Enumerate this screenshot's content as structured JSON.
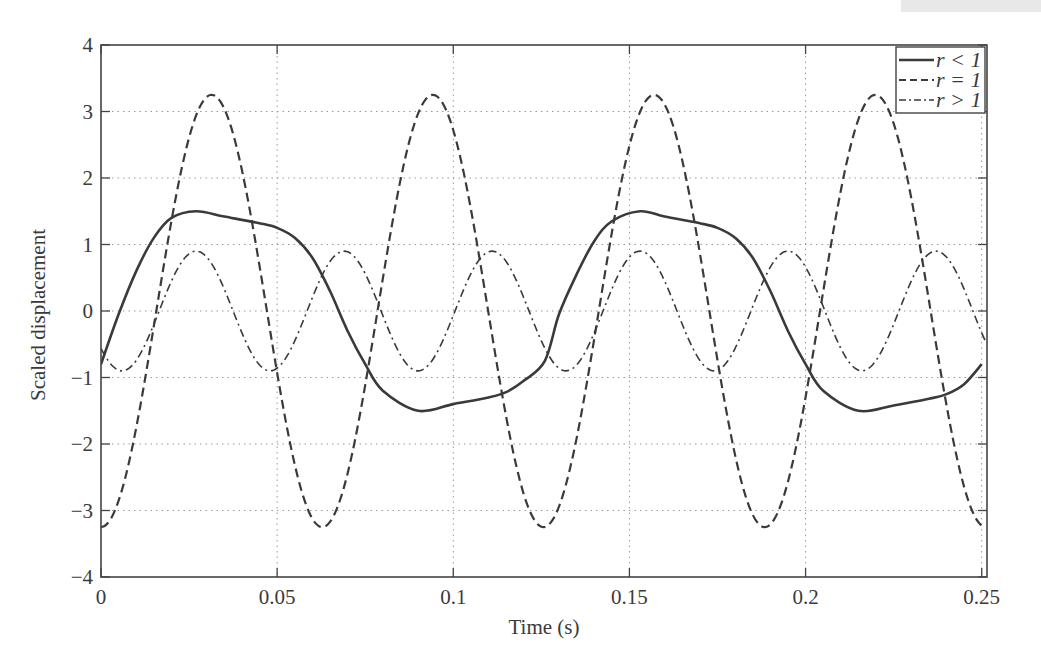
{
  "chart_data": {
    "type": "line",
    "title": "",
    "xlabel": "Time (s)",
    "ylabel": "Scaled displacement",
    "xlim": [
      0,
      0.25
    ],
    "ylim": [
      -4,
      4
    ],
    "grid": true,
    "legend_position": "upper right",
    "x_ticks": [
      0,
      0.05,
      0.1,
      0.15,
      0.2,
      0.25
    ],
    "x_tick_labels": [
      "0",
      "0.05",
      "0.1",
      "0.15",
      "0.2",
      "0.25"
    ],
    "y_ticks": [
      -4,
      -3,
      -2,
      -1,
      0,
      1,
      2,
      3,
      4
    ],
    "y_tick_labels": [
      "−4",
      "−3",
      "−2",
      "−1",
      "0",
      "1",
      "2",
      "3",
      "4"
    ],
    "series": [
      {
        "name": "r < 1",
        "style": "solid",
        "x": [
          0,
          0.005,
          0.01,
          0.015,
          0.02,
          0.027,
          0.035,
          0.045,
          0.05,
          0.055,
          0.06,
          0.065,
          0.07,
          0.075,
          0.08,
          0.09,
          0.1,
          0.11,
          0.115,
          0.12,
          0.126,
          0.13,
          0.135,
          0.14,
          0.145,
          0.153,
          0.16,
          0.17,
          0.175,
          0.18,
          0.185,
          0.19,
          0.195,
          0.2,
          0.205,
          0.215,
          0.225,
          0.235,
          0.24,
          0.245,
          0.25
        ],
        "values": [
          -0.8,
          -0.05,
          0.6,
          1.1,
          1.4,
          1.5,
          1.42,
          1.32,
          1.25,
          1.1,
          0.8,
          0.3,
          -0.3,
          -0.8,
          -1.2,
          -1.5,
          -1.4,
          -1.3,
          -1.22,
          -1.05,
          -0.75,
          -0.05,
          0.55,
          1.05,
          1.35,
          1.5,
          1.42,
          1.32,
          1.25,
          1.1,
          0.8,
          0.3,
          -0.3,
          -0.8,
          -1.2,
          -1.5,
          -1.42,
          -1.32,
          -1.25,
          -1.1,
          -0.8
        ]
      },
      {
        "name": "r = 1",
        "style": "dashed",
        "amplitude": 3.25,
        "period": 0.0628,
        "x": [
          0,
          0.008,
          0.016,
          0.0235,
          0.031,
          0.039,
          0.047,
          0.055,
          0.063,
          0.071,
          0.079,
          0.087,
          0.094,
          0.102,
          0.11,
          0.118,
          0.126,
          0.134,
          0.142,
          0.15,
          0.157,
          0.165,
          0.173,
          0.181,
          0.189,
          0.197,
          0.205,
          0.213,
          0.22,
          0.228,
          0.236,
          0.244,
          0.251
        ],
        "values": [
          -3.25,
          -2.3,
          0.0,
          2.3,
          3.25,
          2.3,
          0.0,
          -2.3,
          -3.25,
          -2.3,
          0.0,
          2.3,
          3.25,
          2.3,
          0.0,
          -2.3,
          -3.25,
          -2.3,
          0.0,
          2.3,
          3.25,
          2.3,
          0.0,
          -2.3,
          -3.25,
          -2.3,
          0.0,
          2.3,
          3.25,
          2.3,
          0.0,
          -2.3,
          -3.25
        ]
      },
      {
        "name": "r > 1",
        "style": "dashdot",
        "amplitude": 0.9,
        "period": 0.042,
        "x": [
          0,
          0.006,
          0.0165,
          0.027,
          0.0375,
          0.048,
          0.0585,
          0.069,
          0.0795,
          0.09,
          0.1005,
          0.111,
          0.1215,
          0.132,
          0.1425,
          0.153,
          0.1635,
          0.174,
          0.1845,
          0.195,
          0.2055,
          0.216,
          0.2265,
          0.237,
          0.2475,
          0.25
        ],
        "values": [
          -0.75,
          -0.9,
          0.0,
          0.9,
          0.0,
          -0.9,
          0.0,
          0.9,
          0.0,
          -0.9,
          0.0,
          0.9,
          0.0,
          -0.9,
          0.0,
          0.9,
          0.0,
          -0.9,
          0.0,
          0.9,
          0.0,
          -0.9,
          0.0,
          0.9,
          0.0,
          -0.3
        ]
      }
    ]
  },
  "legend": {
    "items": [
      {
        "label": "r < 1",
        "style": "solid"
      },
      {
        "label": "r = 1",
        "style": "dashed"
      },
      {
        "label": "r > 1",
        "style": "dashdot"
      }
    ]
  },
  "colors": {
    "line": "#3a3a3a",
    "grid": "#9a9a9a",
    "axis": "#444444",
    "background": "#ffffff"
  }
}
